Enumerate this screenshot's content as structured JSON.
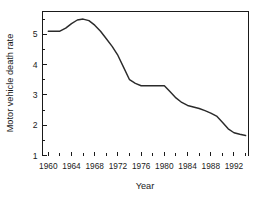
{
  "chart_data": {
    "type": "line",
    "title": "",
    "xlabel": "Year",
    "ylabel": "Motor vehicle death rate",
    "xlim": [
      1959,
      1994.5
    ],
    "ylim": [
      1,
      5.75
    ],
    "grid": false,
    "legend": false,
    "x_ticks_major": [
      1960,
      1964,
      1968,
      1972,
      1976,
      1980,
      1984,
      1988,
      1992
    ],
    "x_tick_labels": [
      "1960",
      "1964",
      "1968",
      "1972",
      "1976",
      "1980",
      "1984",
      "1988",
      "1992"
    ],
    "x_ticks_minor": [
      1962,
      1966,
      1970,
      1974,
      1978,
      1982,
      1986,
      1990,
      1994
    ],
    "y_ticks_major": [
      1,
      2,
      3,
      4,
      5
    ],
    "y_tick_labels": [
      "1",
      "2",
      "3",
      "4",
      "5"
    ],
    "y_ticks_minor": [
      1.5,
      2.5,
      3.5,
      4.5,
      5.5
    ],
    "line_color": "#2b2b2b",
    "axis_color": "#1a1a1a",
    "background_color": "#ffffff",
    "x": [
      1960,
      1961,
      1962,
      1963,
      1964,
      1965,
      1966,
      1967,
      1968,
      1969,
      1970,
      1971,
      1972,
      1973,
      1974,
      1975,
      1976,
      1977,
      1978,
      1979,
      1980,
      1981,
      1982,
      1983,
      1984,
      1985,
      1986,
      1987,
      1988,
      1989,
      1990,
      1991,
      1992,
      1993,
      1994
    ],
    "values": [
      5.1,
      5.1,
      5.1,
      5.2,
      5.35,
      5.47,
      5.5,
      5.45,
      5.3,
      5.1,
      4.85,
      4.6,
      4.3,
      3.9,
      3.5,
      3.38,
      3.3,
      3.3,
      3.3,
      3.3,
      3.3,
      3.1,
      2.9,
      2.75,
      2.65,
      2.6,
      2.55,
      2.48,
      2.4,
      2.3,
      2.1,
      1.88,
      1.75,
      1.7,
      1.66
    ],
    "series": [
      {
        "name": "Motor vehicle death rate",
        "values": [
          5.1,
          5.1,
          5.1,
          5.2,
          5.35,
          5.47,
          5.5,
          5.45,
          5.3,
          5.1,
          4.85,
          4.6,
          4.3,
          3.9,
          3.5,
          3.38,
          3.3,
          3.3,
          3.3,
          3.3,
          3.3,
          3.1,
          2.9,
          2.75,
          2.65,
          2.6,
          2.55,
          2.48,
          2.4,
          2.3,
          2.1,
          1.88,
          1.75,
          1.7,
          1.66
        ]
      }
    ],
    "annotations": []
  }
}
